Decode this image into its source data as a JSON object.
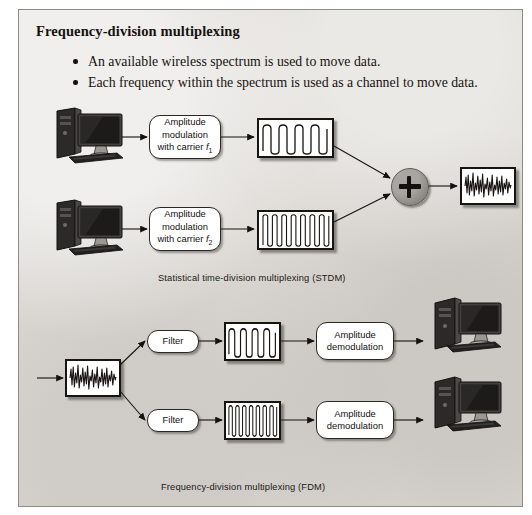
{
  "slide": {
    "title": "Frequency-division multiplexing",
    "bullets": [
      "An available wireless spectrum is used to move data.",
      "Each frequency within the spectrum is used as a channel to move data."
    ]
  },
  "diagrams": [
    {
      "id": "stdm",
      "caption": "Statistical time-division multiplexing (STDM)",
      "nodes": {
        "source_computer_1": "computer-workstation",
        "source_computer_2": "computer-workstation",
        "modulator_1": {
          "line1": "Amplitude",
          "line2": "modulation",
          "line3_prefix": "with carrier ",
          "carrier": "f",
          "carrier_sub": "1"
        },
        "modulator_2": {
          "line1": "Amplitude",
          "line2": "modulation",
          "line3_prefix": "with carrier ",
          "carrier": "f",
          "carrier_sub": "2"
        },
        "signal_1": {
          "kind": "low-frequency-carrier-waveform",
          "cycles": 4
        },
        "signal_2": {
          "kind": "high-frequency-carrier-waveform",
          "cycles": 14
        },
        "summer": "+",
        "combined_signal": {
          "kind": "composite-multiplexed-waveform"
        }
      }
    },
    {
      "id": "fdm",
      "caption": "Frequency-division multiplexing (FDM)",
      "nodes": {
        "incoming_signal": {
          "kind": "composite-multiplexed-waveform"
        },
        "filter_1": "Filter",
        "filter_2": "Filter",
        "signal_1": {
          "kind": "low-frequency-carrier-waveform",
          "cycles": 4
        },
        "signal_2": {
          "kind": "high-frequency-carrier-waveform",
          "cycles": 14
        },
        "demodulator_1": {
          "line1": "Amplitude",
          "line2": "demodulation"
        },
        "demodulator_2": {
          "line1": "Amplitude",
          "line2": "demodulation"
        },
        "dest_computer_1": "computer-workstation",
        "dest_computer_2": "computer-workstation"
      }
    }
  ],
  "colors": {
    "page_background": "#dedbd6",
    "ink": "#16120f",
    "box_fill": "#ffffff",
    "summer_fill": "#8d8a85"
  }
}
